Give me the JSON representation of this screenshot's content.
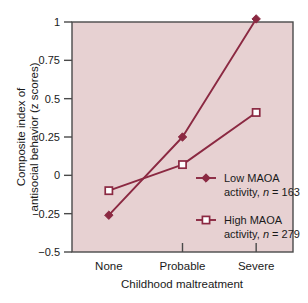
{
  "figure": {
    "plot_background_color": "#e7d1d2",
    "frame_color": "#4a4a4a",
    "series_color": "#8b2942",
    "text_color": "#1a1a1a"
  },
  "chart_data": {
    "type": "line",
    "title": "",
    "subtitle": "",
    "xlabel": "Childhood maltreatment",
    "ylabel": "Composite index of antisocial behavior (z scores)",
    "ylabel_line1": "Composite index of",
    "ylabel_line2": "antisocial behavior (z scores)",
    "categories": [
      "None",
      "Probable",
      "Severe"
    ],
    "ylim": [
      -0.5,
      1
    ],
    "yticks": [
      -0.5,
      -0.25,
      0,
      0.25,
      0.5,
      0.75,
      1
    ],
    "ytick_labels": [
      "−0.5",
      "−0.25",
      "0",
      "0.25",
      "0.5",
      "0.75",
      "1"
    ],
    "grid": false,
    "legend_position": "inside-lower-right",
    "series": [
      {
        "name": "Low MAOA activity, n = 163",
        "name_line1": "Low MAOA",
        "name_line2_pre": "activity, ",
        "name_line2_italic": "n",
        "name_line2_post": " = 163",
        "marker": "filled-diamond",
        "values": [
          -0.26,
          0.25,
          1.02
        ]
      },
      {
        "name": "High MAOA activity, n = 279",
        "name_line1": "High MAOA",
        "name_line2_pre": "activity, ",
        "name_line2_italic": "n",
        "name_line2_post": " = 279",
        "marker": "open-square",
        "values": [
          -0.1,
          0.07,
          0.41
        ]
      }
    ]
  }
}
